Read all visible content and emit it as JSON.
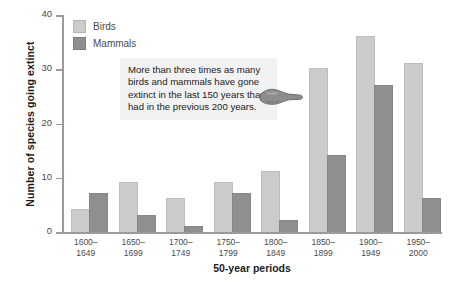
{
  "chart_data": {
    "type": "bar",
    "title": "",
    "xlabel": "50-year periods",
    "ylabel": "Number of species going extinct",
    "categories": [
      "1600–\n1649",
      "1650–\n1699",
      "1700–\n1749",
      "1750–\n1799",
      "1800–\n1849",
      "1850–\n1899",
      "1900–\n1949",
      "1950–\n2000"
    ],
    "categories_line1": [
      "1600–",
      "1650–",
      "1700–",
      "1750–",
      "1800–",
      "1850–",
      "1900–",
      "1950–"
    ],
    "categories_line2": [
      "1649",
      "1699",
      "1749",
      "1799",
      "1849",
      "1899",
      "1949",
      "2000"
    ],
    "series": [
      {
        "name": "Birds",
        "color": "#cbcbcb",
        "values": [
          4,
          9,
          6,
          9,
          11,
          30,
          36,
          31
        ]
      },
      {
        "name": "Mammals",
        "color": "#8f8f8f",
        "values": [
          7,
          3,
          1,
          7,
          2,
          14,
          27,
          6
        ]
      }
    ],
    "ylim": [
      0,
      40
    ],
    "yticks": [
      0,
      10,
      20,
      30,
      40
    ],
    "ytick_labels": [
      "0",
      "10",
      "20",
      "30",
      "40"
    ],
    "grid": false,
    "legend_position": "top-left"
  },
  "annotation": {
    "text": "More than three times as many birds and mammals have gone extinct in the last 150 years than had in the previous 200 years.",
    "icon": "pointing-hand-icon"
  },
  "colors": {
    "birds": "#cbcbcb",
    "mammals": "#8f8f8f",
    "axis": "#9a9a9a",
    "text": "#1c1c1c",
    "annotation_background": "#f2f2f2"
  }
}
